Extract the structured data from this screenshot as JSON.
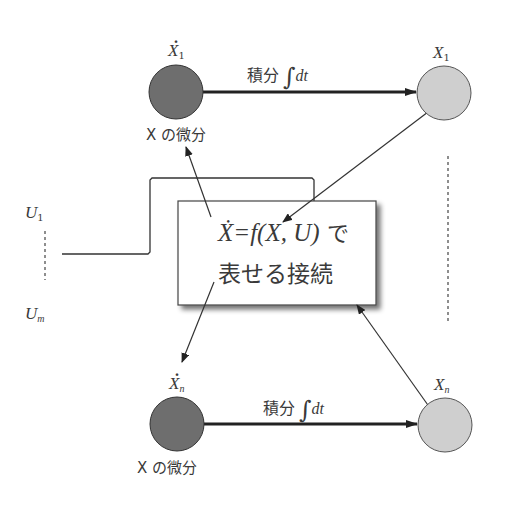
{
  "diagram": {
    "type": "state-space-block-diagram",
    "colors": {
      "derivative_node_fill": "#6e6e6e",
      "state_node_fill": "#cfcfcf",
      "box_fill": "#ffffff",
      "line": "#333333"
    },
    "nodes": {
      "x1_dot": {
        "var": "X",
        "sub": "1",
        "dotted": true,
        "caption": "X の微分"
      },
      "x1": {
        "var": "X",
        "sub": "1"
      },
      "xn_dot": {
        "var": "X",
        "sub": "n",
        "dotted": true,
        "caption": "X の微分"
      },
      "xn": {
        "var": "X",
        "sub": "n"
      }
    },
    "edges": {
      "top_integral_label": "積分",
      "bottom_integral_label": "積分",
      "integral_symbol": "∫",
      "integral_dt": "dt"
    },
    "inputs": {
      "u1": {
        "var": "U",
        "sub": "1"
      },
      "um": {
        "var": "U",
        "sub": "m"
      }
    },
    "center_box": {
      "line1_equation": "Ẋ=f(X, U)",
      "line1_suffix": " で",
      "line2": "表せる接続"
    }
  }
}
